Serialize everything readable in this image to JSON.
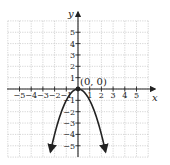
{
  "chart_data": {
    "type": "line",
    "title": "",
    "xlabel": "x",
    "ylabel": "y",
    "xlim": [
      -6,
      6
    ],
    "ylim": [
      -6,
      6
    ],
    "grid": true,
    "x_ticks": [
      -5,
      -4,
      -3,
      -2,
      -1,
      1,
      2,
      3,
      4,
      5
    ],
    "y_ticks": [
      -5,
      -4,
      -3,
      -2,
      -1,
      1,
      2,
      3,
      4,
      5
    ],
    "x_tick_labels": [
      "−5",
      "−4",
      "−3",
      "−2",
      "−1",
      "1",
      "2",
      "3",
      "4",
      "5"
    ],
    "y_tick_labels": [
      "−5",
      "−4",
      "−3",
      "−2",
      "−1",
      "1",
      "2",
      "3",
      "4",
      "5"
    ],
    "series": [
      {
        "name": "y = -x^2",
        "x": [
          -2.35,
          -2,
          -1.5,
          -1,
          -0.5,
          0,
          0.5,
          1,
          1.5,
          2,
          2.35
        ],
        "y": [
          -5.52,
          -4,
          -2.25,
          -1,
          -0.25,
          0,
          -0.25,
          -1,
          -2.25,
          -4,
          -5.52
        ],
        "arrows_at_ends": true
      }
    ],
    "annotations": [
      {
        "text": "(0, 0)",
        "x": 0,
        "y": 0,
        "marker": "point"
      }
    ]
  },
  "labels": {
    "x_axis": "x",
    "y_axis": "y",
    "vertex": "(0, 0)"
  },
  "colors": {
    "curve": "#222222",
    "grid": "#b8b8b8",
    "axis": "#222222"
  }
}
